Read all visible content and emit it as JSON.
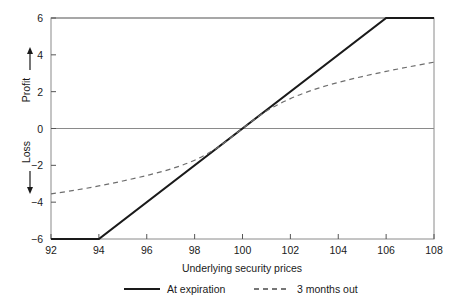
{
  "chart_data": {
    "type": "line",
    "title": "",
    "xlabel": "Underlying security prices",
    "ylabel_top": "Profit",
    "ylabel_bottom": "Loss",
    "ylabel_top_arrow": "↑",
    "ylabel_bottom_arrow": "↓",
    "xlim": [
      92,
      108
    ],
    "ylim": [
      -6,
      6
    ],
    "xticks": [
      92,
      94,
      96,
      98,
      100,
      102,
      104,
      106,
      108
    ],
    "xtick_labels": [
      "92",
      "94",
      "96",
      "98",
      "100",
      "102",
      "104",
      "106",
      "108"
    ],
    "yticks": [
      6,
      4,
      2,
      0,
      -2,
      -4,
      -6
    ],
    "ytick_labels": [
      "6",
      "4",
      "2",
      "0",
      "−2",
      "−4",
      "−6"
    ],
    "grid": false,
    "gridlines_y": [
      0,
      6
    ],
    "zero_line": 0,
    "legend_position": "bottom",
    "series": [
      {
        "name": "At expiration",
        "style": "solid",
        "color": "#1a1a1a",
        "width": 2.2,
        "points": [
          {
            "x": 92,
            "y": -6
          },
          {
            "x": 94,
            "y": -6
          },
          {
            "x": 100,
            "y": 0
          },
          {
            "x": 106,
            "y": 6
          },
          {
            "x": 108,
            "y": 6
          }
        ]
      },
      {
        "name": "3 months out",
        "style": "dashed",
        "color": "#6e6e6e",
        "width": 1.2,
        "points": [
          {
            "x": 92,
            "y": -3.55
          },
          {
            "x": 93,
            "y": -3.35
          },
          {
            "x": 94,
            "y": -3.12
          },
          {
            "x": 95,
            "y": -2.85
          },
          {
            "x": 96,
            "y": -2.55
          },
          {
            "x": 97,
            "y": -2.2
          },
          {
            "x": 98,
            "y": -1.72
          },
          {
            "x": 99,
            "y": -1.0
          },
          {
            "x": 100,
            "y": 0.0
          },
          {
            "x": 101,
            "y": 0.95
          },
          {
            "x": 102,
            "y": 1.62
          },
          {
            "x": 103,
            "y": 2.12
          },
          {
            "x": 104,
            "y": 2.5
          },
          {
            "x": 105,
            "y": 2.82
          },
          {
            "x": 106,
            "y": 3.1
          },
          {
            "x": 107,
            "y": 3.36
          },
          {
            "x": 108,
            "y": 3.6
          }
        ]
      }
    ]
  },
  "legend": {
    "items": [
      {
        "label": "At expiration",
        "style": "solid"
      },
      {
        "label": "3 months out",
        "style": "dashed"
      }
    ]
  },
  "colors": {
    "axis": "#555555",
    "frame": "#777777",
    "solid_series": "#1a1a1a",
    "dashed_series": "#6e6e6e",
    "text": "#1a1a1a",
    "background": "#ffffff"
  }
}
